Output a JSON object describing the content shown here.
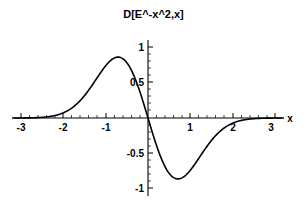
{
  "figure": {
    "title": "D[E^-x^2,x]",
    "background_color": "#ffffff",
    "line_color": "#000000",
    "axis_color": "#000000"
  },
  "axes": {
    "x_axis_label": "x",
    "y_axis_label": ""
  },
  "chart_data": {
    "type": "line",
    "title": "D[E^-x^2,x]",
    "xlabel": "x",
    "ylabel": "",
    "xlim": [
      -3.2,
      3.2
    ],
    "ylim": [
      -1.15,
      1.15
    ],
    "grid": false,
    "legend": null,
    "axis_style": "centered-cross",
    "xticks": [
      -3,
      -2,
      -1,
      1,
      2,
      3
    ],
    "xtick_labels": [
      "-3",
      "-2",
      "-1",
      "1",
      "2",
      "3"
    ],
    "yticks": [
      1,
      0.5,
      -0.5,
      -1
    ],
    "ytick_labels": [
      "1",
      "0.5",
      "-0.5",
      "-1"
    ],
    "series": [
      {
        "name": "D[E^-x^2,x]",
        "expression": "-2*x*exp(-x^2)",
        "x": [
          -3.2,
          -3.0,
          -2.8,
          -2.6,
          -2.4,
          -2.2,
          -2.0,
          -1.8,
          -1.6,
          -1.4,
          -1.2,
          -1.0,
          -0.9,
          -0.8,
          -0.7071,
          -0.6,
          -0.5,
          -0.4,
          -0.3,
          -0.2,
          -0.1,
          0.0,
          0.1,
          0.2,
          0.3,
          0.4,
          0.5,
          0.6,
          0.7071,
          0.8,
          0.9,
          1.0,
          1.2,
          1.4,
          1.6,
          1.8,
          2.0,
          2.2,
          2.4,
          2.6,
          2.8,
          3.0,
          3.2
        ],
        "y": [
          0.000225,
          0.00074,
          0.00228,
          0.00663,
          0.01813,
          0.04659,
          0.11226,
          0.25383,
          0.53727,
          1.0627,
          0.56835,
          0.73576,
          0.80074,
          0.84367,
          0.85776,
          0.83728,
          0.7788,
          0.68155,
          0.54881,
          0.38431,
          0.19801,
          0.0,
          -0.19801,
          -0.38431,
          -0.54881,
          -0.68155,
          -0.7788,
          -0.83728,
          -0.85776,
          -0.84367,
          -0.80074,
          -0.73576,
          -0.56835,
          -0.39476,
          -0.24553,
          -0.13946,
          -0.07326,
          -0.03573,
          -0.01626,
          -0.00692,
          -0.00276,
          -0.00103,
          -0.00036
        ]
      }
    ],
    "annotations": {
      "maximum": {
        "x": -0.7071,
        "y": 0.8578
      },
      "minimum": {
        "x": 0.7071,
        "y": -0.8578
      },
      "zero_crossing": {
        "x": 0,
        "y": 0
      }
    }
  }
}
